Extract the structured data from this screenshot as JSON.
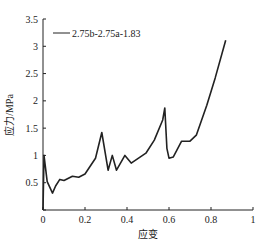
{
  "chart_data": {
    "type": "line",
    "title": "",
    "xlabel": "应变",
    "ylabel": "应力/MPa",
    "xlim": [
      0,
      1
    ],
    "ylim": [
      0,
      3.5
    ],
    "xticks": [
      "0",
      "0.2",
      "0.4",
      "0.6",
      "0.8",
      "1"
    ],
    "yticks": [
      "0",
      "0.5",
      "1",
      "1.5",
      "2",
      "2.5",
      "3",
      "3.5"
    ],
    "grid": false,
    "legend_position": "upper-left",
    "series": [
      {
        "name": "2.75b-2.75a-1.83",
        "color": "#222222",
        "x": [
          0.0,
          0.005,
          0.02,
          0.045,
          0.06,
          0.08,
          0.1,
          0.14,
          0.17,
          0.2,
          0.25,
          0.28,
          0.31,
          0.33,
          0.35,
          0.39,
          0.42,
          0.49,
          0.53,
          0.57,
          0.58,
          0.59,
          0.6,
          0.62,
          0.66,
          0.7,
          0.73,
          0.78,
          0.82,
          0.87
        ],
        "y": [
          0.0,
          1.0,
          0.52,
          0.31,
          0.44,
          0.56,
          0.54,
          0.62,
          0.6,
          0.66,
          0.95,
          1.42,
          0.73,
          1.0,
          0.73,
          1.0,
          0.86,
          1.04,
          1.28,
          1.65,
          1.87,
          1.13,
          0.95,
          0.97,
          1.26,
          1.26,
          1.37,
          1.92,
          2.42,
          3.11
        ]
      }
    ]
  }
}
